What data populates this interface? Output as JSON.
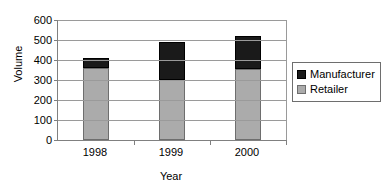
{
  "chart_data": {
    "type": "bar",
    "subtype": "stacked-bar",
    "title": "",
    "xlabel": "Year",
    "ylabel": "Volume",
    "categories": [
      "1998",
      "1999",
      "2000"
    ],
    "series": [
      {
        "name": "Retailer",
        "values": [
          360,
          300,
          355
        ],
        "color": "#ababab"
      },
      {
        "name": "Manufacturer",
        "values": [
          50,
          190,
          165
        ],
        "color": "#1a1a1a"
      }
    ],
    "stack_order": [
      "Retailer",
      "Manufacturer"
    ],
    "totals": [
      410,
      490,
      520
    ],
    "ylim": [
      0,
      600
    ],
    "ytick_step": 100,
    "yticks": [
      0,
      100,
      200,
      300,
      400,
      500,
      600
    ],
    "ytick_labels": [
      "0",
      "100",
      "200",
      "300",
      "400",
      "500",
      "600"
    ],
    "grid": true,
    "grid_axis": "y",
    "legend_position": "right",
    "legend_entries": [
      "Manufacturer",
      "Retailer"
    ],
    "plot_background": "#ffffff",
    "axis_color": "#808080",
    "gridline_color": "#9a9a9a",
    "bar_border_color": "#6e6e6e"
  }
}
